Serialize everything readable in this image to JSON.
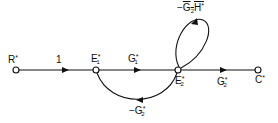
{
  "diagram": {
    "type": "signal-flow-graph",
    "nodes": [
      {
        "id": "R",
        "label": "R",
        "mark": "*"
      },
      {
        "id": "E1",
        "label": "E",
        "sub": "1",
        "mark": "*"
      },
      {
        "id": "E2",
        "label": "E",
        "sub": "2",
        "mark": "*"
      },
      {
        "id": "C",
        "label": "C",
        "mark": "*"
      }
    ],
    "branches": [
      {
        "from": "R",
        "to": "E1",
        "gain": "1"
      },
      {
        "from": "E1",
        "to": "E2",
        "gain_base": "G",
        "gain_sub": "1",
        "gain_mark": "*"
      },
      {
        "from": "E2",
        "to": "C",
        "gain_base": "G",
        "gain_sub": "2",
        "gain_mark": "*"
      },
      {
        "from": "E2",
        "to": "E1",
        "gain_prefix": "−",
        "gain_base": "G",
        "gain_sub": "2",
        "gain_mark": "*"
      },
      {
        "from": "E2",
        "to": "E2",
        "gain_prefix": "−",
        "gain_overline": "G",
        "gain_sub": "2",
        "gain_rest": "H",
        "gain_mark": "*"
      }
    ],
    "colors": {
      "stroke": "#111111",
      "background": "#ffffff"
    }
  }
}
